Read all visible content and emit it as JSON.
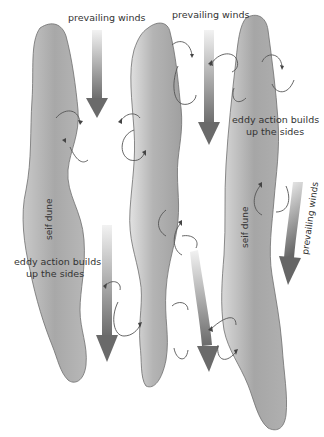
{
  "diagram": {
    "labels": {
      "wind_top_left": "prevailing winds",
      "wind_top_right": "prevailing winds",
      "wind_diagonal": "prevailing winds",
      "eddy_right_line1": "eddy action builds",
      "eddy_right_line2": "up the sides",
      "eddy_left_line1": "eddy action builds",
      "eddy_left_line2": "up the sides",
      "dune_left": "seif dune",
      "dune_right": "seif dune"
    },
    "colors": {
      "dune_fill_dark": "#9a9a9a",
      "dune_fill_light": "#d6d6d6",
      "arrow_dark": "#6a6a6a",
      "arrow_light": "#ececec",
      "outline": "#6f6f6f",
      "text": "#333333"
    },
    "elements": {
      "dunes": 3,
      "wind_arrows": 5,
      "eddy_loops": 14
    }
  }
}
